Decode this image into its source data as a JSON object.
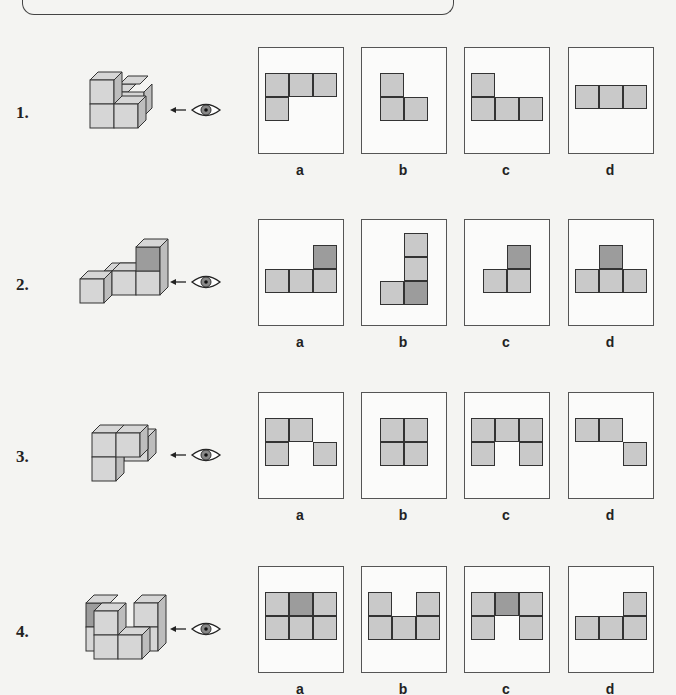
{
  "header": {
    "text": ""
  },
  "colors": {
    "cell_light": "#c9c9c9",
    "cell_dark": "#9c9c9c",
    "box_border": "#555555",
    "background": "#f4f4f2"
  },
  "icons": {
    "eye": "eye-icon",
    "arrow": "arrow-left-icon"
  },
  "problems": [
    {
      "number": "1.",
      "options": [
        {
          "label": "a",
          "cells": [
            [
              0,
              0,
              0
            ],
            [
              1,
              0,
              0
            ],
            [
              2,
              0,
              0
            ],
            [
              0,
              1,
              0
            ]
          ]
        },
        {
          "label": "b",
          "cells": [
            [
              0,
              0,
              0
            ],
            [
              0,
              1,
              0
            ],
            [
              1,
              1,
              0
            ]
          ]
        },
        {
          "label": "c",
          "cells": [
            [
              0,
              0,
              0
            ],
            [
              0,
              1,
              0
            ],
            [
              1,
              1,
              0
            ],
            [
              2,
              1,
              0
            ]
          ]
        },
        {
          "label": "d",
          "cells": [
            [
              0,
              0,
              0
            ],
            [
              1,
              0,
              0
            ],
            [
              2,
              0,
              0
            ]
          ]
        }
      ]
    },
    {
      "number": "2.",
      "options": [
        {
          "label": "a",
          "cells": [
            [
              2,
              0,
              1
            ],
            [
              0,
              1,
              0
            ],
            [
              1,
              1,
              0
            ],
            [
              2,
              1,
              0
            ]
          ]
        },
        {
          "label": "b",
          "cells": [
            [
              1,
              0,
              0
            ],
            [
              1,
              1,
              0
            ],
            [
              0,
              2,
              0
            ],
            [
              1,
              2,
              1
            ]
          ]
        },
        {
          "label": "c",
          "cells": [
            [
              1,
              0,
              1
            ],
            [
              0,
              1,
              0
            ],
            [
              1,
              1,
              0
            ]
          ]
        },
        {
          "label": "d",
          "cells": [
            [
              1,
              0,
              1
            ],
            [
              0,
              1,
              0
            ],
            [
              1,
              1,
              0
            ],
            [
              2,
              1,
              0
            ]
          ]
        }
      ]
    },
    {
      "number": "3.",
      "options": [
        {
          "label": "a",
          "cells": [
            [
              0,
              0,
              0
            ],
            [
              1,
              0,
              0
            ],
            [
              0,
              1,
              0
            ],
            [
              2,
              1,
              0
            ]
          ]
        },
        {
          "label": "b",
          "cells": [
            [
              0,
              0,
              0
            ],
            [
              1,
              0,
              0
            ],
            [
              0,
              1,
              0
            ],
            [
              1,
              1,
              0
            ]
          ]
        },
        {
          "label": "c",
          "cells": [
            [
              0,
              0,
              0
            ],
            [
              1,
              0,
              0
            ],
            [
              2,
              0,
              0
            ],
            [
              0,
              1,
              0
            ],
            [
              2,
              1,
              0
            ]
          ]
        },
        {
          "label": "d",
          "cells": [
            [
              0,
              0,
              0
            ],
            [
              1,
              0,
              0
            ],
            [
              2,
              1,
              0
            ]
          ]
        }
      ]
    },
    {
      "number": "4.",
      "options": [
        {
          "label": "a",
          "cells": [
            [
              0,
              0,
              0
            ],
            [
              1,
              0,
              1
            ],
            [
              2,
              0,
              0
            ],
            [
              0,
              1,
              0
            ],
            [
              1,
              1,
              0
            ],
            [
              2,
              1,
              0
            ]
          ]
        },
        {
          "label": "b",
          "cells": [
            [
              0,
              0,
              0
            ],
            [
              2,
              0,
              0
            ],
            [
              0,
              1,
              0
            ],
            [
              1,
              1,
              0
            ],
            [
              2,
              1,
              0
            ]
          ]
        },
        {
          "label": "c",
          "cells": [
            [
              0,
              0,
              0
            ],
            [
              1,
              0,
              1
            ],
            [
              2,
              0,
              0
            ],
            [
              0,
              1,
              0
            ],
            [
              2,
              1,
              0
            ]
          ]
        },
        {
          "label": "d",
          "cells": [
            [
              2,
              0,
              0
            ],
            [
              0,
              1,
              0
            ],
            [
              1,
              1,
              0
            ],
            [
              2,
              1,
              0
            ]
          ]
        }
      ]
    }
  ]
}
